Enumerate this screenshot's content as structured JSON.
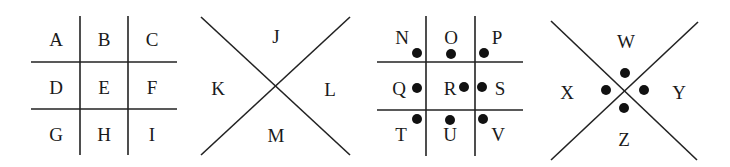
{
  "grid1": {
    "letters": [
      "A",
      "B",
      "C",
      "D",
      "E",
      "F",
      "G",
      "H",
      "I"
    ]
  },
  "x1": {
    "top": "J",
    "left": "K",
    "right": "L",
    "bottom": "M"
  },
  "grid2": {
    "letters": [
      "N",
      "O",
      "P",
      "Q",
      "R",
      "S",
      "T",
      "U",
      "V"
    ]
  },
  "x2": {
    "top": "W",
    "left": "X",
    "right": "Y",
    "bottom": "Z"
  },
  "colors": {
    "ink": "#1a1a1a",
    "background": "#ffffff"
  }
}
